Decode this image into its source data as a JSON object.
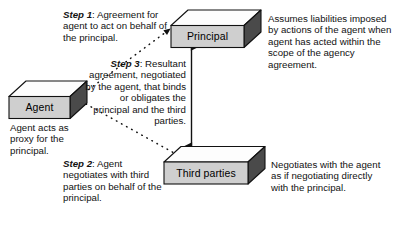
{
  "diagram": {
    "colors": {
      "box_front": "#cfcfcf",
      "box_top": "#fdfdfd",
      "box_side": "#4a4a4a",
      "outline": "#111111",
      "text": "#111111",
      "background": "#ffffff"
    },
    "nodes": [
      {
        "id": "principal",
        "label": "Principal"
      },
      {
        "id": "agent",
        "label": "Agent"
      },
      {
        "id": "third-parties",
        "label": "Third parties"
      }
    ],
    "steps": [
      {
        "id": "step-1",
        "prefix": "Step 1",
        "separator": ":",
        "text": " Agreement for agent to act on behalf of the principal.",
        "from": "agent",
        "to": "principal",
        "line": "dashed"
      },
      {
        "id": "step-2",
        "prefix": "Step 2",
        "separator": ":",
        "text": " Agent negotiates with third parties on behalf of the principal.",
        "from": "agent",
        "to": "third-parties",
        "line": "dashed"
      },
      {
        "id": "step-3",
        "prefix": "Step 3",
        "separator": ":",
        "text": " Resultant agreement, negotiated by the agent, that binds or obligates the principal and the third parties.",
        "from": "principal",
        "to": "third-parties",
        "line": "solid-double-arrow"
      }
    ],
    "annotations": [
      {
        "id": "principal-note",
        "node": "principal",
        "text": "Assumes liabilities imposed by actions of the agent when agent has acted within the scope of the agency agreement."
      },
      {
        "id": "agent-note",
        "node": "agent",
        "text": "Agent acts as proxy for the principal."
      },
      {
        "id": "third-parties-note",
        "node": "third-parties",
        "text": "Negotiates with the agent as if negotiating directly with the principal."
      }
    ]
  }
}
